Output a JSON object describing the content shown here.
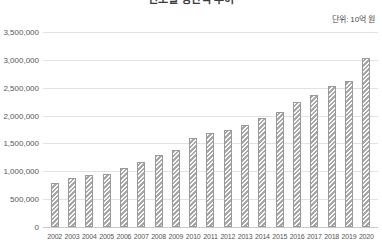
{
  "chart_data": {
    "type": "bar",
    "title": "연도별 생산액 추이",
    "unit_note": "단위: 10억 원",
    "xlabel": "",
    "ylabel": "",
    "ylim": [
      0,
      3500000
    ],
    "grid": true,
    "legend": "none",
    "categories": [
      "2002",
      "2003",
      "2004",
      "2005",
      "2006",
      "2007",
      "2008",
      "2009",
      "2010",
      "2011",
      "2012",
      "2013",
      "2014",
      "2015",
      "2016",
      "2017",
      "2018",
      "2019",
      "2020"
    ],
    "values": [
      790000,
      880000,
      930000,
      960000,
      1060000,
      1160000,
      1290000,
      1380000,
      1600000,
      1690000,
      1740000,
      1830000,
      1950000,
      2060000,
      2250000,
      2370000,
      2530000,
      2620000,
      3030000
    ],
    "ytick_labels": [
      "3,500,000",
      "3,000,000",
      "2,500,000",
      "2,000,000",
      "1,500,000",
      "1,000,000",
      "500,000",
      "0"
    ],
    "ytick_values": [
      3500000,
      3000000,
      2500000,
      2000000,
      1500000,
      1000000,
      500000,
      0
    ],
    "bar_color": "#a7a7a7",
    "bar_pattern": "diagonal-hatch",
    "gridline_color": "#e2e2e2"
  }
}
